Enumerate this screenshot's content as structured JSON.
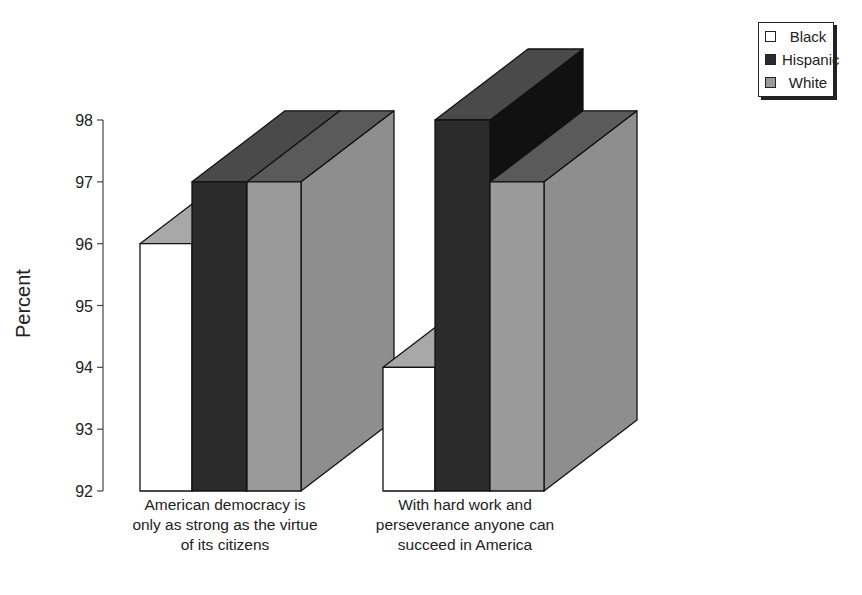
{
  "chart_data": {
    "type": "bar",
    "style": "3d-grouped",
    "title": "",
    "xlabel": "",
    "ylabel": "Percent",
    "ylim": [
      92,
      98
    ],
    "yticks": [
      92,
      93,
      94,
      95,
      96,
      97,
      98
    ],
    "grid": false,
    "legend_position": "top-right",
    "categories": [
      "American democracy is only as strong as the virtue of its citizens",
      "With hard work and perseverance anyone can succeed in America"
    ],
    "category_lines": [
      [
        "American democracy is",
        "only as strong as the virtue",
        "of its citizens"
      ],
      [
        "With hard work and",
        "perseverance anyone can",
        "succeed in America"
      ]
    ],
    "series": [
      {
        "name": "Black",
        "values": [
          96,
          94
        ],
        "color": "#ffffff"
      },
      {
        "name": "Hispanic",
        "values": [
          97,
          98
        ],
        "color": "#2b2b2b"
      },
      {
        "name": "White",
        "values": [
          97,
          97
        ],
        "color": "#9a9a9a"
      }
    ]
  },
  "legend": {
    "items": [
      {
        "label": "Black",
        "color": "#ffffff"
      },
      {
        "label": "Hispanic",
        "color": "#2b2b2b"
      },
      {
        "label": "White",
        "color": "#9a9a9a"
      }
    ]
  }
}
